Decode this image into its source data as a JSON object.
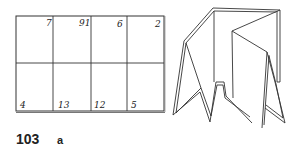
{
  "figure": {
    "number": "103",
    "label": "a"
  },
  "grid_sheet": {
    "top_row_numbers": [
      "7",
      "91",
      "6",
      "2"
    ],
    "bottom_row_numbers": [
      "4",
      "13",
      "12",
      "5"
    ],
    "columns": 4,
    "rows": 2
  },
  "folded_model": {
    "description": "Accordion-folded sheet standing upright"
  }
}
